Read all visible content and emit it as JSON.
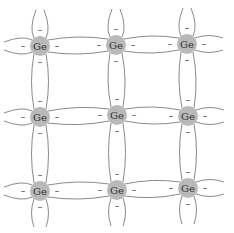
{
  "diagram": {
    "type": "crystal-lattice",
    "element_label": "Ge",
    "electron_symbol": "–",
    "colors": {
      "atom_fill": "#b9b9b9",
      "bond_stroke": "#8a8a8a",
      "text": "#333333",
      "background": "#ffffff"
    },
    "atom_radius": 10,
    "atoms": [
      {
        "row": 0,
        "col": 0,
        "label": "Ge",
        "x": 40,
        "y": 46
      },
      {
        "row": 0,
        "col": 1,
        "label": "Ge",
        "x": 116,
        "y": 45
      },
      {
        "row": 0,
        "col": 2,
        "label": "Ge",
        "x": 187,
        "y": 44
      },
      {
        "row": 1,
        "col": 0,
        "label": "Ge",
        "x": 40,
        "y": 117
      },
      {
        "row": 1,
        "col": 1,
        "label": "Ge",
        "x": 117,
        "y": 115
      },
      {
        "row": 1,
        "col": 2,
        "label": "Ge",
        "x": 188,
        "y": 116
      },
      {
        "row": 2,
        "col": 0,
        "label": "Ge",
        "x": 40,
        "y": 191
      },
      {
        "row": 2,
        "col": 1,
        "label": "Ge",
        "x": 117,
        "y": 190
      },
      {
        "row": 2,
        "col": 2,
        "label": "Ge",
        "x": 188,
        "y": 188
      }
    ]
  }
}
